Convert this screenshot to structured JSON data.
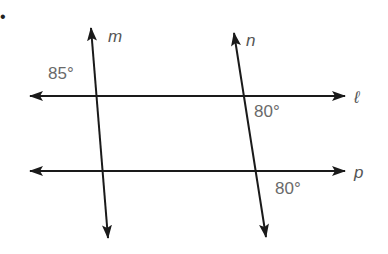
{
  "diagram": {
    "problem_marker": "•",
    "lines": [
      {
        "name": "m",
        "type": "transversal",
        "x1": 91,
        "y1": 28,
        "x2": 108,
        "y2": 238,
        "label_x": 108,
        "label_y": 42
      },
      {
        "name": "n",
        "type": "transversal",
        "x1": 234,
        "y1": 33,
        "x2": 266,
        "y2": 237,
        "label_x": 246,
        "label_y": 46
      },
      {
        "name": "ℓ",
        "type": "horizontal",
        "x1": 30,
        "y1": 96,
        "x2": 345,
        "y2": 96,
        "label_x": 354,
        "label_y": 103
      },
      {
        "name": "p",
        "type": "horizontal",
        "x1": 30,
        "y1": 171,
        "x2": 345,
        "y2": 171,
        "label_x": 354,
        "label_y": 178
      }
    ],
    "angles": [
      {
        "label": "85°",
        "at": "m ∩ ℓ, upper-left",
        "x": 48,
        "y": 79
      },
      {
        "label": "80°",
        "at": "n ∩ ℓ, lower-right",
        "x": 254,
        "y": 117
      },
      {
        "label": "80°",
        "at": "n ∩ p, lower-right",
        "x": 275,
        "y": 194
      }
    ],
    "colors": {
      "line": "#1a1a1a",
      "angle_text": "#6a6a6a",
      "line_label": "#555555"
    }
  }
}
